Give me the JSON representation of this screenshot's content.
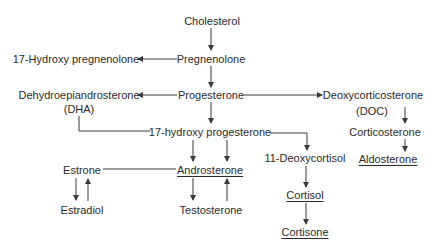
{
  "diagram": {
    "type": "steroid-biosynthesis-flowchart",
    "nodes": {
      "cholesterol": {
        "label": "Cholesterol",
        "underlined": false
      },
      "pregnenolone": {
        "label": "Pregnenolone",
        "underlined": false
      },
      "hydroxy_pregnenolone": {
        "label": "17-Hydroxy pregnenolone",
        "underlined": false
      },
      "progesterone": {
        "label": "Progesterone",
        "underlined": false
      },
      "dha": {
        "label": "Dehydroepiandrosterone",
        "sublabel": "(DHA)",
        "underlined": false
      },
      "doc": {
        "label": "Deoxycorticosterone",
        "sublabel": "(DOC)",
        "underlined": false
      },
      "hydroxy_progesterone": {
        "label": "17-hydroxy progesterone",
        "underlined": false
      },
      "corticosterone": {
        "label": "Corticosterone",
        "underlined": false
      },
      "deoxycortisol": {
        "label": "11-Deoxycortisol",
        "underlined": false
      },
      "aldosterone": {
        "label": "Aldosterone",
        "underlined": true
      },
      "estrone": {
        "label": "Estrone",
        "underlined": false
      },
      "androsterone": {
        "label": "Androsterone",
        "underlined": true
      },
      "estradiol": {
        "label": "Estradiol",
        "underlined": false
      },
      "testosterone": {
        "label": "Testosterone",
        "underlined": false
      },
      "cortisol": {
        "label": "Cortisol",
        "underlined": true
      },
      "cortisone": {
        "label": "Cortisone",
        "underlined": true
      }
    },
    "edges": [
      {
        "from": "Cholesterol",
        "to": "Pregnenolone",
        "arrow": true
      },
      {
        "from": "Pregnenolone",
        "to": "17-Hydroxy pregnenolone",
        "arrow": true
      },
      {
        "from": "Pregnenolone",
        "to": "Progesterone",
        "arrow": true
      },
      {
        "from": "Progesterone",
        "to": "Dehydroepiandrosterone (DHA)",
        "arrow": true
      },
      {
        "from": "Progesterone",
        "to": "Deoxycorticosterone (DOC)",
        "arrow": true
      },
      {
        "from": "Progesterone",
        "to": "17-hydroxy progesterone",
        "arrow": true
      },
      {
        "from": "Dehydroepiandrosterone (DHA)",
        "to": "17-hydroxy progesterone",
        "arrow": false
      },
      {
        "from": "Deoxycorticosterone (DOC)",
        "to": "Corticosterone",
        "arrow": true
      },
      {
        "from": "Corticosterone",
        "to": "Aldosterone",
        "arrow": true
      },
      {
        "from": "17-hydroxy progesterone",
        "to": "Androsterone",
        "arrow": true,
        "count": 2
      },
      {
        "from": "17-hydroxy progesterone",
        "to": "11-Deoxycortisol",
        "arrow": true
      },
      {
        "from": "Estrone",
        "to": "Androsterone",
        "arrow": false
      },
      {
        "from": "Estrone",
        "to": "Estradiol",
        "arrow": true
      },
      {
        "from": "Estradiol",
        "to": "Estrone",
        "arrow": true
      },
      {
        "from": "Androsterone",
        "to": "Testosterone",
        "arrow": true
      },
      {
        "from": "Testosterone",
        "to": "Androsterone",
        "arrow": true
      },
      {
        "from": "11-Deoxycortisol",
        "to": "Cortisol",
        "arrow": true
      },
      {
        "from": "Cortisol",
        "to": "Cortisone",
        "arrow": true
      }
    ],
    "colors": {
      "text": "#2b2b2b",
      "lines": "#3a3a3a",
      "background": "#ffffff"
    }
  }
}
